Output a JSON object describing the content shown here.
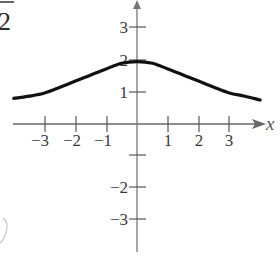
{
  "chart_data": {
    "type": "line",
    "title": "",
    "xlabel": "x",
    "ylabel": "",
    "xlim": [
      -4,
      4
    ],
    "ylim": [
      -4,
      4
    ],
    "grid": false,
    "legend": null,
    "x_ticks": [
      -3,
      -2,
      -1,
      1,
      2,
      3
    ],
    "x_tick_labels": [
      "−3",
      "−2",
      "−1",
      "1",
      "2",
      "3"
    ],
    "y_ticks": [
      3,
      2,
      1,
      -1,
      -2,
      -3
    ],
    "y_tick_labels": [
      "3",
      "2",
      "1",
      "",
      "−2",
      "−3"
    ],
    "series": [
      {
        "name": "f(x)",
        "x": [
          -4,
          -3.5,
          -3,
          -2.5,
          -2,
          -1.5,
          -1,
          -0.5,
          0,
          0.5,
          1,
          1.5,
          2,
          2.5,
          3,
          3.5,
          4
        ],
        "y": [
          0.8,
          0.87,
          0.97,
          1.15,
          1.34,
          1.53,
          1.72,
          1.9,
          1.95,
          1.9,
          1.72,
          1.53,
          1.34,
          1.15,
          0.97,
          0.87,
          0.75
        ]
      }
    ],
    "annotations": [
      "2 (cropped fragment, top-left, with overline)"
    ]
  },
  "fragment_text": "2",
  "axis_label_x": "x"
}
